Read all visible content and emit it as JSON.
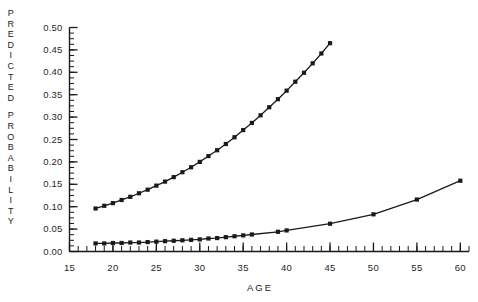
{
  "chart_data": {
    "type": "line",
    "title": "",
    "xlabel": "AGE",
    "ylabel": "PREDICTED PROBABILITY",
    "xlim": [
      15,
      61
    ],
    "ylim": [
      0.0,
      0.5
    ],
    "xticks": [
      15,
      20,
      25,
      30,
      35,
      40,
      45,
      50,
      55,
      60
    ],
    "xtick_labels": [
      "15",
      "20",
      "25",
      "30",
      "35",
      "40",
      "45",
      "50",
      "55",
      "60"
    ],
    "x_minor_tick_step": 1,
    "yticks": [
      0.0,
      0.05,
      0.1,
      0.15,
      0.2,
      0.25,
      0.3,
      0.35,
      0.4,
      0.45,
      0.5
    ],
    "ytick_labels": [
      "0.00",
      "0.05",
      "0.10",
      "0.15",
      "0.20",
      "0.25",
      "0.30",
      "0.35",
      "0.40",
      "0.45",
      "0.50"
    ],
    "y_minor_tick_step": 0.0125,
    "grid": false,
    "legend": "none",
    "marker": "square",
    "line_color": "#1a1a1a",
    "background": "#ffffff",
    "series": [
      {
        "name": "upper-curve",
        "x": [
          18,
          19,
          20,
          21,
          22,
          23,
          24,
          25,
          26,
          27,
          28,
          29,
          30,
          31,
          32,
          33,
          34,
          35,
          36,
          37,
          38,
          39,
          40,
          41,
          42,
          43,
          44,
          45
        ],
        "values": [
          0.096,
          0.102,
          0.108,
          0.115,
          0.122,
          0.13,
          0.138,
          0.147,
          0.156,
          0.166,
          0.177,
          0.188,
          0.2,
          0.213,
          0.226,
          0.24,
          0.255,
          0.271,
          0.287,
          0.304,
          0.322,
          0.34,
          0.359,
          0.379,
          0.399,
          0.42,
          0.442,
          0.465
        ]
      },
      {
        "name": "lower-curve",
        "x": [
          18,
          19,
          20,
          21,
          22,
          23,
          24,
          25,
          26,
          27,
          28,
          29,
          30,
          31,
          32,
          33,
          34,
          35,
          36,
          39,
          40,
          45,
          50,
          55,
          60
        ],
        "values": [
          0.018,
          0.018,
          0.019,
          0.019,
          0.02,
          0.02,
          0.021,
          0.022,
          0.023,
          0.024,
          0.025,
          0.026,
          0.027,
          0.029,
          0.03,
          0.032,
          0.034,
          0.036,
          0.038,
          0.044,
          0.047,
          0.062,
          0.083,
          0.116,
          0.158
        ]
      }
    ]
  },
  "axis": {
    "y_title_letters": [
      "P",
      "R",
      "E",
      "D",
      "I",
      "C",
      "T",
      "E",
      "D",
      "",
      "P",
      "R",
      "O",
      "B",
      "A",
      "B",
      "I",
      "L",
      "I",
      "T",
      "Y"
    ],
    "x_title": "AGE"
  }
}
